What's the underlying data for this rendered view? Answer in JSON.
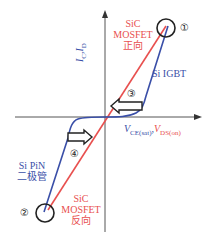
{
  "diagram": {
    "type": "I-V characteristic comparison",
    "y_axis_label": {
      "main": "I",
      "sub1": "C",
      "sep": ",",
      "main2": "I",
      "sub2": "D"
    },
    "x_axis_label": {
      "part1_main": "V",
      "part1_sub": "CE(sat)",
      "sep": ",",
      "part2_main": "V",
      "part2_sub": "DS(on)"
    },
    "curves": [
      {
        "name": "SiC MOSFET forward",
        "label_lines": [
          "SiC",
          "MOSFET",
          "正向"
        ],
        "color": "#e8504f"
      },
      {
        "name": "Si IGBT",
        "label": "Si IGBT",
        "color": "#3a4fa8"
      },
      {
        "name": "Si PiN diode",
        "label_lines": [
          "Si PiN",
          "二极管"
        ],
        "color": "#3a4fa8"
      },
      {
        "name": "SiC MOSFET reverse",
        "label_lines": [
          "SiC",
          "MOSFET",
          "反向"
        ],
        "color": "#e8504f"
      }
    ],
    "markers": [
      {
        "id": "1",
        "glyph": "①"
      },
      {
        "id": "2",
        "glyph": "②"
      },
      {
        "id": "3",
        "glyph": "③"
      },
      {
        "id": "4",
        "glyph": "④"
      }
    ],
    "colors": {
      "sic": "#e8504f",
      "si": "#3a4fa8",
      "axis": "#555555"
    }
  }
}
